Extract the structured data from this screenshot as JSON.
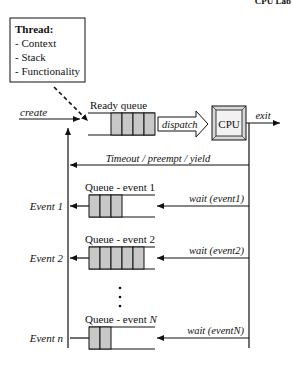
{
  "header_fragment": "CPU Lab",
  "thread_box": {
    "title": "Thread:",
    "items": [
      "- Context",
      "- Stack",
      "- Functionality"
    ]
  },
  "ready_queue": {
    "label": "Ready queue",
    "slots": 4
  },
  "dispatch_label": "dispatch",
  "cpu_label": "CPU",
  "exit_label": "exit",
  "create_label": "create",
  "timeout_label": "Timeout / preempt / yield",
  "event_queues": [
    {
      "label_prefix": "Queue - event ",
      "label_suffix": "1",
      "event_label": "Event 1",
      "wait_label": "wait (event1)",
      "slots": 3
    },
    {
      "label_prefix": "Queue - event ",
      "label_suffix": "2",
      "event_label": "Event 2",
      "wait_label": "wait (event2)",
      "slots": 5
    },
    {
      "label_prefix": "Queue - event ",
      "label_suffix": "N",
      "event_label": "Event n",
      "wait_label": "wait (eventN)",
      "slots": 2
    }
  ],
  "ellipsis": "⋮",
  "colors": {
    "line": "#111111",
    "slot_fill": "#c8c8c8",
    "cpu_outer": "#d8d8d8",
    "cpu_inner": "#f2f2f2"
  }
}
